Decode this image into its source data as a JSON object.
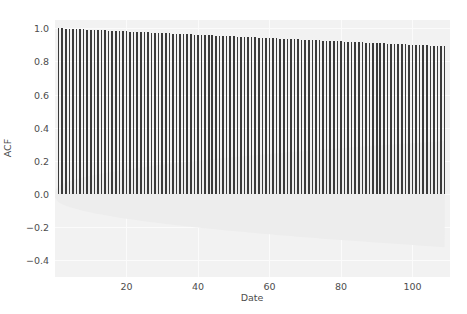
{
  "chart_data": {
    "type": "bar",
    "title": "",
    "subtitle": "",
    "xlabel": "Date",
    "ylabel": "ACF",
    "xlim": [
      0,
      110.5
    ],
    "ylim": [
      -0.5,
      1.05
    ],
    "xticks": [
      20,
      40,
      60,
      80,
      100
    ],
    "xticklabels": [
      "20",
      "40",
      "60",
      "80",
      "100"
    ],
    "yticks": [
      -0.4,
      -0.2,
      0.0,
      0.2,
      0.4,
      0.6,
      0.8,
      1.0
    ],
    "yticklabels": [
      "-0.4",
      "-0.2",
      "0.0",
      "0.2",
      "0.4",
      "0.6",
      "0.8",
      "1.0"
    ],
    "grid": true,
    "legend": null,
    "x": [
      1,
      2,
      3,
      4,
      5,
      6,
      7,
      8,
      9,
      10,
      11,
      12,
      13,
      14,
      15,
      16,
      17,
      18,
      19,
      20,
      21,
      22,
      23,
      24,
      25,
      26,
      27,
      28,
      29,
      30,
      31,
      32,
      33,
      34,
      35,
      36,
      37,
      38,
      39,
      40,
      41,
      42,
      43,
      44,
      45,
      46,
      47,
      48,
      49,
      50,
      51,
      52,
      53,
      54,
      55,
      56,
      57,
      58,
      59,
      60,
      61,
      62,
      63,
      64,
      65,
      66,
      67,
      68,
      69,
      70,
      71,
      72,
      73,
      74,
      75,
      76,
      77,
      78,
      79,
      80,
      81,
      82,
      83,
      84,
      85,
      86,
      87,
      88,
      89,
      90,
      91,
      92,
      93,
      94,
      95,
      96,
      97,
      98,
      99,
      100,
      101,
      102,
      103,
      104,
      105,
      106,
      107,
      108,
      109
    ],
    "values": [
      1.0,
      0.999,
      0.998,
      0.997,
      0.996,
      0.995,
      0.994,
      0.993,
      0.992,
      0.991,
      0.99,
      0.989,
      0.988,
      0.987,
      0.986,
      0.985,
      0.984,
      0.983,
      0.982,
      0.981,
      0.98,
      0.979,
      0.978,
      0.977,
      0.976,
      0.975,
      0.974,
      0.973,
      0.972,
      0.971,
      0.97,
      0.969,
      0.968,
      0.967,
      0.966,
      0.965,
      0.964,
      0.963,
      0.962,
      0.961,
      0.96,
      0.959,
      0.958,
      0.957,
      0.956,
      0.955,
      0.954,
      0.953,
      0.952,
      0.951,
      0.95,
      0.949,
      0.948,
      0.947,
      0.946,
      0.945,
      0.944,
      0.943,
      0.942,
      0.941,
      0.94,
      0.939,
      0.938,
      0.937,
      0.936,
      0.935,
      0.934,
      0.933,
      0.932,
      0.931,
      0.93,
      0.929,
      0.928,
      0.927,
      0.926,
      0.925,
      0.924,
      0.923,
      0.922,
      0.921,
      0.92,
      0.919,
      0.918,
      0.917,
      0.916,
      0.915,
      0.914,
      0.913,
      0.912,
      0.911,
      0.91,
      0.909,
      0.908,
      0.907,
      0.906,
      0.905,
      0.904,
      0.903,
      0.902,
      0.901,
      0.9,
      0.899,
      0.898,
      0.897,
      0.896,
      0.895,
      0.894,
      0.893,
      0.892
    ],
    "confidence_band": {
      "visible": true,
      "side": "below-zero",
      "note": "faint shaded significance envelope widening with lag",
      "color": "#ededed"
    },
    "colors": {
      "bar": "#3a3a3a",
      "panel_background": "#f2f2f2",
      "gridline": "#fbfbfb",
      "tick_text": "#4d4d4d",
      "figure_background": "#ffffff"
    }
  }
}
